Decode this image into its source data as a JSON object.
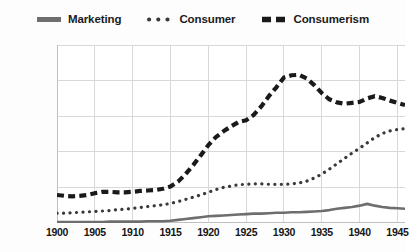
{
  "chart_data": {
    "type": "line",
    "title": "",
    "subtitle": "",
    "xlabel": "",
    "ylabel": "",
    "xlim": [
      1900,
      1946
    ],
    "ylim": [
      0,
      0.004
    ],
    "grid": true,
    "legend_position": "top",
    "y_tick_labels": [
      "0.004%",
      "0.0032%",
      "0.0024%",
      "0.0016%",
      "0.0008%",
      "0.00%"
    ],
    "y_tick_values": [
      0.004,
      0.0032,
      0.0024,
      0.0016,
      0.0008,
      0
    ],
    "x_tick_labels": [
      "1900",
      "1905",
      "1910",
      "1915",
      "1920",
      "1925",
      "1930",
      "1935",
      "1940",
      "1945"
    ],
    "x_tick_values": [
      1900,
      1905,
      1910,
      1915,
      1920,
      1925,
      1930,
      1935,
      1940,
      1945
    ],
    "x": [
      1900,
      1901,
      1902,
      1903,
      1904,
      1905,
      1906,
      1907,
      1908,
      1909,
      1910,
      1911,
      1912,
      1913,
      1914,
      1915,
      1916,
      1917,
      1918,
      1919,
      1920,
      1921,
      1922,
      1923,
      1924,
      1925,
      1926,
      1927,
      1928,
      1929,
      1930,
      1931,
      1932,
      1933,
      1934,
      1935,
      1936,
      1937,
      1938,
      1939,
      1940,
      1941,
      1942,
      1943,
      1944,
      1945,
      1946
    ],
    "series": [
      {
        "name": "Marketing",
        "style": "solid",
        "color": "#6e6e6e",
        "values": [
          2e-05,
          2e-05,
          2e-05,
          2e-05,
          2e-05,
          2e-05,
          2e-05,
          3e-05,
          3e-05,
          3e-05,
          3e-05,
          3e-05,
          4e-05,
          4e-05,
          4e-05,
          5e-05,
          7e-05,
          9e-05,
          0.00011,
          0.00013,
          0.00015,
          0.00016,
          0.00017,
          0.00018,
          0.00019,
          0.0002,
          0.00021,
          0.00021,
          0.00022,
          0.00023,
          0.00023,
          0.00024,
          0.00024,
          0.00025,
          0.00026,
          0.00027,
          0.00029,
          0.00032,
          0.00034,
          0.00036,
          0.00039,
          0.00043,
          0.00039,
          0.00036,
          0.00034,
          0.00033,
          0.00032
        ]
      },
      {
        "name": "Consumer",
        "style": "dotted",
        "color": "#3a3a3a",
        "values": [
          0.00022,
          0.00022,
          0.00023,
          0.00024,
          0.00025,
          0.00026,
          0.00027,
          0.00028,
          0.0003,
          0.00031,
          0.00033,
          0.00035,
          0.00037,
          0.00039,
          0.00041,
          0.00044,
          0.00048,
          0.00053,
          0.00058,
          0.00063,
          0.00069,
          0.00075,
          0.0008,
          0.00083,
          0.00086,
          0.00087,
          0.00088,
          0.00088,
          0.00087,
          0.00087,
          0.00087,
          0.00088,
          0.0009,
          0.00094,
          0.00101,
          0.0011,
          0.00121,
          0.00133,
          0.00145,
          0.00157,
          0.00168,
          0.0018,
          0.00192,
          0.00201,
          0.00207,
          0.0021,
          0.00212
        ]
      },
      {
        "name": "Consumerism",
        "style": "dashed",
        "color": "#1a1a1a",
        "values": [
          0.00063,
          0.00061,
          0.0006,
          0.00061,
          0.00063,
          0.00067,
          0.0007,
          0.0007,
          0.00069,
          0.00069,
          0.0007,
          0.00072,
          0.00073,
          0.00074,
          0.00077,
          0.00082,
          0.00093,
          0.0011,
          0.0013,
          0.00152,
          0.00175,
          0.00193,
          0.00206,
          0.00217,
          0.00227,
          0.00231,
          0.00243,
          0.00262,
          0.00285,
          0.00305,
          0.00327,
          0.00332,
          0.00333,
          0.00325,
          0.0031,
          0.00292,
          0.00278,
          0.00271,
          0.00268,
          0.0027,
          0.00272,
          0.0028,
          0.00285,
          0.00281,
          0.00275,
          0.0027,
          0.00265
        ]
      }
    ]
  },
  "legend": {
    "items": [
      {
        "label": "Marketing",
        "marker": "solid-line-marker"
      },
      {
        "label": "Consumer",
        "marker": "dotted-line-marker"
      },
      {
        "label": "Consumerism",
        "marker": "dashed-line-marker"
      }
    ]
  }
}
